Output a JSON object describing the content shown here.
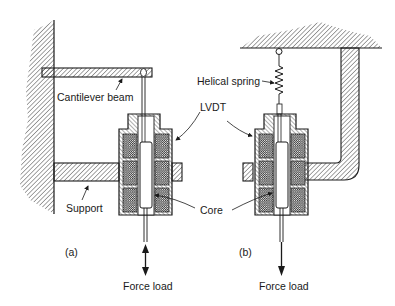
{
  "diagram": {
    "subfigures": [
      {
        "id": "a",
        "label": "(a)",
        "components": [
          "Cantilever beam",
          "LVDT",
          "Support",
          "Core"
        ],
        "load_label": "Force load",
        "load_direction": "bidirectional"
      },
      {
        "id": "b",
        "label": "(b)",
        "components": [
          "Helical spring",
          "LVDT",
          "Core"
        ],
        "load_label": "Force load",
        "load_direction": "down"
      }
    ]
  },
  "labels": {
    "cantilever_beam": "Cantilever beam",
    "lvdt": "LVDT",
    "support": "Support",
    "core": "Core",
    "helical_spring": "Helical spring",
    "fig_a": "(a)",
    "fig_b": "(b)",
    "force_load_a": "Force load",
    "force_load_b": "Force load"
  },
  "colors": {
    "ink": "#1a1a1a",
    "background": "#ffffff"
  }
}
